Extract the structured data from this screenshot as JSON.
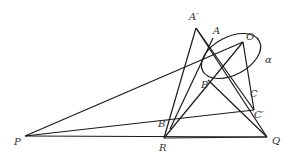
{
  "diagram": {
    "type": "projective-geometry-figure",
    "ellipse_label": "α",
    "points": {
      "A_prime": {
        "label": "A′",
        "x": 196,
        "y": 28
      },
      "A": {
        "label": "A",
        "x": 213,
        "y": 38
      },
      "O": {
        "label": "O",
        "x": 243,
        "y": 42
      },
      "B": {
        "label": "B",
        "x": 208,
        "y": 80
      },
      "C": {
        "label": "C",
        "x": 248,
        "y": 89
      },
      "C_prime": {
        "label": "C′",
        "x": 254,
        "y": 110
      },
      "B_prime": {
        "label": "B′",
        "x": 170,
        "y": 129
      },
      "R": {
        "label": "R",
        "x": 164,
        "y": 138
      },
      "Q": {
        "label": "Q",
        "x": 267,
        "y": 137
      },
      "P": {
        "label": "P",
        "x": 25,
        "y": 136
      }
    },
    "stroke_color": "#1a1a1a",
    "background": "#ffffff"
  }
}
